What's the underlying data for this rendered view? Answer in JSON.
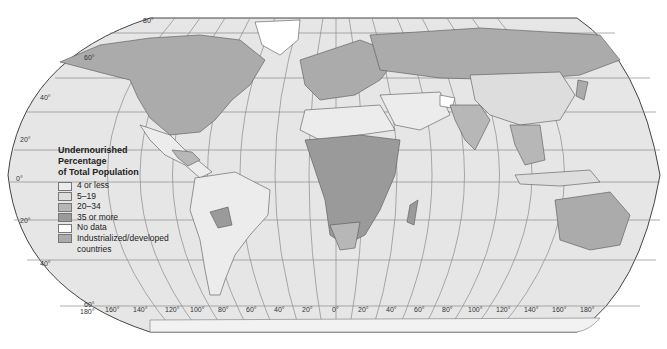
{
  "map": {
    "projection": "Robinson",
    "ocean_color": "#e6e6e6",
    "graticule_color": "#8a8a8a",
    "border_color": "#555555"
  },
  "legend": {
    "title_line1": "Undernourished",
    "title_line2": "Percentage",
    "title_line3": "of Total Population",
    "items": [
      {
        "label": "4 or less",
        "color": "#ececec"
      },
      {
        "label": "5–19",
        "color": "#dddddd"
      },
      {
        "label": "20–34",
        "color": "#b7b7b7"
      },
      {
        "label": "35 or more",
        "color": "#9a9a9a"
      },
      {
        "label": "No data",
        "color": "#ffffff"
      },
      {
        "label": "Industrialized/developed",
        "label2": "countries",
        "color": "#ababab"
      }
    ]
  },
  "latitude_labels": [
    "80°",
    "60°",
    "40°",
    "20°",
    "0°",
    "20°",
    "40°",
    "60°"
  ],
  "longitude_labels": [
    "180°",
    "160°",
    "140°",
    "120°",
    "100°",
    "80°",
    "60°",
    "40°",
    "20°",
    "0°",
    "20°",
    "40°",
    "60°",
    "80°",
    "100°",
    "120°",
    "140°",
    "160°",
    "180°"
  ]
}
